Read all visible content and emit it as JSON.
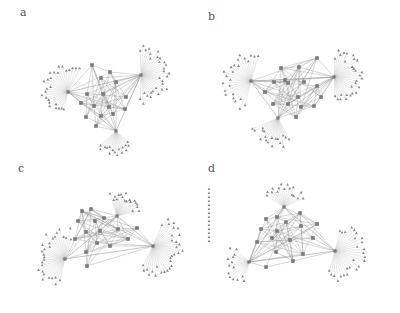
{
  "figure": {
    "panels": [
      {
        "id": "a",
        "label": "a",
        "left": 0,
        "top": 0,
        "label_x": 20,
        "label_y": 18,
        "hubs": [
          {
            "x": 68,
            "y": 92,
            "n": 26,
            "r": 26,
            "start": 100,
            "end": 300
          },
          {
            "x": 141,
            "y": 75,
            "n": 30,
            "r": 28,
            "start": -95,
            "end": 95
          },
          {
            "x": 116,
            "y": 131,
            "n": 16,
            "r": 24,
            "start": 40,
            "end": 140
          }
        ],
        "core": [
          [
            92,
            65
          ],
          [
            101,
            78
          ],
          [
            116,
            82
          ],
          [
            87,
            94
          ],
          [
            103,
            94
          ],
          [
            126,
            97
          ],
          [
            81,
            103
          ],
          [
            94,
            106
          ],
          [
            109,
            107
          ],
          [
            125,
            109
          ],
          [
            101,
            116
          ],
          [
            113,
            114
          ],
          [
            86,
            117
          ],
          [
            96,
            126
          ],
          [
            110,
            72
          ]
        ]
      },
      {
        "id": "b",
        "label": "b",
        "left": 200,
        "top": 0,
        "label_x": 8,
        "label_y": 22,
        "hubs": [
          {
            "x": 51,
            "y": 81,
            "n": 24,
            "r": 30,
            "start": 100,
            "end": 290
          },
          {
            "x": 134,
            "y": 77,
            "n": 28,
            "r": 28,
            "start": -90,
            "end": 90
          },
          {
            "x": 78,
            "y": 118,
            "n": 18,
            "r": 28,
            "start": 60,
            "end": 160
          }
        ],
        "core": [
          [
            81,
            68
          ],
          [
            99,
            67
          ],
          [
            117,
            58
          ],
          [
            74,
            82
          ],
          [
            88,
            83
          ],
          [
            104,
            82
          ],
          [
            117,
            86
          ],
          [
            65,
            92
          ],
          [
            98,
            97
          ],
          [
            121,
            97
          ],
          [
            73,
            104
          ],
          [
            88,
            104
          ],
          [
            101,
            107
          ],
          [
            114,
            106
          ],
          [
            96,
            117
          ],
          [
            85,
            80
          ]
        ]
      },
      {
        "id": "c",
        "label": "c",
        "left": 0,
        "top": 156,
        "label_x": 18,
        "label_y": 18,
        "hubs": [
          {
            "x": 65,
            "y": 103,
            "n": 28,
            "r": 30,
            "start": 100,
            "end": 290
          },
          {
            "x": 117,
            "y": 60,
            "n": 18,
            "r": 24,
            "start": -110,
            "end": -10
          },
          {
            "x": 153,
            "y": 90,
            "n": 30,
            "r": 30,
            "start": -70,
            "end": 120
          }
        ],
        "core": [
          [
            82,
            55
          ],
          [
            91,
            53
          ],
          [
            78,
            65
          ],
          [
            95,
            65
          ],
          [
            104,
            62
          ],
          [
            86,
            76
          ],
          [
            100,
            75
          ],
          [
            118,
            73
          ],
          [
            137,
            72
          ],
          [
            75,
            83
          ],
          [
            97,
            87
          ],
          [
            110,
            90
          ],
          [
            86,
            96
          ],
          [
            128,
            83
          ],
          [
            87,
            110
          ]
        ]
      },
      {
        "id": "d",
        "label": "d",
        "left": 200,
        "top": 156,
        "label_x": 8,
        "label_y": 18,
        "hubs": [
          {
            "x": 84,
            "y": 51,
            "n": 16,
            "r": 22,
            "start": -150,
            "end": -20
          },
          {
            "x": 135,
            "y": 95,
            "n": 26,
            "r": 30,
            "start": -80,
            "end": 110
          },
          {
            "x": 49,
            "y": 106,
            "n": 14,
            "r": 24,
            "start": 100,
            "end": 230
          }
        ],
        "core": [
          [
            66,
            63
          ],
          [
            77,
            61
          ],
          [
            100,
            57
          ],
          [
            86,
            66
          ],
          [
            61,
            73
          ],
          [
            77,
            75
          ],
          [
            101,
            70
          ],
          [
            117,
            68
          ],
          [
            72,
            82
          ],
          [
            90,
            84
          ],
          [
            113,
            82
          ],
          [
            57,
            86
          ],
          [
            76,
            96
          ],
          [
            103,
            98
          ],
          [
            93,
            105
          ],
          [
            66,
            111
          ]
        ],
        "isolated_column": {
          "x": 9,
          "y_start": 33,
          "y_end": 85,
          "count": 14
        }
      }
    ],
    "colors": {
      "edge": "#bdbdbd",
      "core_edge": "#8e8e8e",
      "node": "#7a7a7a",
      "leaf": "#8a8a8a"
    }
  }
}
